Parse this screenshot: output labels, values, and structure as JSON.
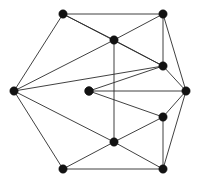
{
  "figure": {
    "background_color": "#ffffff",
    "edge_color": "#2b2b2b",
    "vertex_color": "#121212",
    "edge_width": 0.9,
    "vertex_radius": 4.2,
    "width": 200,
    "height": 183,
    "vertex_count": 12,
    "edge_count": 26
  },
  "chart_data": {
    "type": "diagram",
    "graph_type": "undirected",
    "vertices": [
      {
        "id": "v1",
        "name": "top-left",
        "x": 63,
        "y": 14,
        "degree": 4
      },
      {
        "id": "v2",
        "name": "top-right",
        "x": 163,
        "y": 14,
        "degree": 4
      },
      {
        "id": "v3",
        "name": "upper-middle",
        "x": 114,
        "y": 40,
        "degree": 5
      },
      {
        "id": "v4",
        "name": "upper-right-inner",
        "x": 163,
        "y": 66,
        "degree": 5
      },
      {
        "id": "v5",
        "name": "left",
        "x": 14,
        "y": 91,
        "degree": 5
      },
      {
        "id": "v6",
        "name": "center",
        "x": 89,
        "y": 91,
        "degree": 3
      },
      {
        "id": "v7",
        "name": "right",
        "x": 186,
        "y": 91,
        "degree": 5
      },
      {
        "id": "v8",
        "name": "lower-right-inner",
        "x": 163,
        "y": 117,
        "degree": 5
      },
      {
        "id": "v9",
        "name": "lower-middle",
        "x": 114,
        "y": 142,
        "degree": 5
      },
      {
        "id": "v10",
        "name": "bottom-left",
        "x": 63,
        "y": 169,
        "degree": 3
      },
      {
        "id": "v11",
        "name": "bottom-right",
        "x": 163,
        "y": 169,
        "degree": 4
      },
      {
        "id": "v12",
        "name": "center-node",
        "x": 89,
        "y": 91,
        "degree": 3
      }
    ],
    "edges": [
      {
        "source": "v1",
        "target": "v2"
      },
      {
        "source": "v1",
        "target": "v3"
      },
      {
        "source": "v1",
        "target": "v5"
      },
      {
        "source": "v1",
        "target": "v4"
      },
      {
        "source": "v2",
        "target": "v3"
      },
      {
        "source": "v2",
        "target": "v4"
      },
      {
        "source": "v2",
        "target": "v7"
      },
      {
        "source": "v3",
        "target": "v4"
      },
      {
        "source": "v3",
        "target": "v5"
      },
      {
        "source": "v3",
        "target": "v9"
      },
      {
        "source": "v4",
        "target": "v5"
      },
      {
        "source": "v4",
        "target": "v6"
      },
      {
        "source": "v4",
        "target": "v7"
      },
      {
        "source": "v5",
        "target": "v9"
      },
      {
        "source": "v5",
        "target": "v10"
      },
      {
        "source": "v6",
        "target": "v7"
      },
      {
        "source": "v6",
        "target": "v8"
      },
      {
        "source": "v7",
        "target": "v8"
      },
      {
        "source": "v7",
        "target": "v11"
      },
      {
        "source": "v8",
        "target": "v9"
      },
      {
        "source": "v8",
        "target": "v11"
      },
      {
        "source": "v9",
        "target": "v10"
      },
      {
        "source": "v9",
        "target": "v11"
      },
      {
        "source": "v10",
        "target": "v11"
      }
    ],
    "xlabel": "",
    "ylabel": "",
    "legend": [],
    "grid": false
  }
}
